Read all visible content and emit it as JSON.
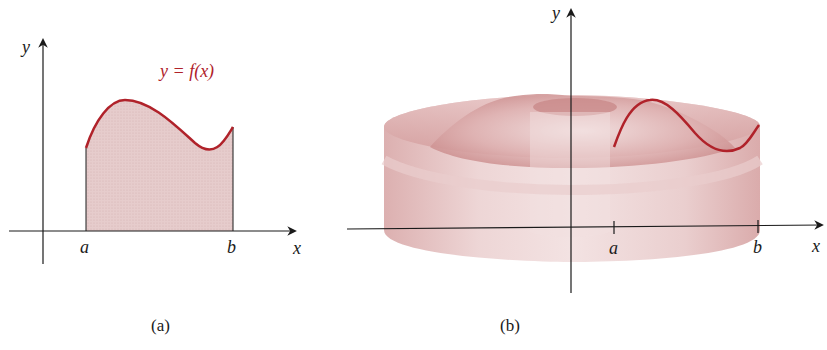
{
  "panel_a": {
    "y_label": "y",
    "x_label": "x",
    "a_label": "a",
    "b_label": "b",
    "curve_label": "y = f(x)",
    "caption": "(a)"
  },
  "panel_b": {
    "y_label": "y",
    "x_label": "x",
    "a_label": "a",
    "b_label": "b",
    "caption": "(b)"
  },
  "colors": {
    "curve": "#b0222a",
    "fill": "#e8cfcf",
    "solid": "#dcaeae",
    "axis": "#1a1a1a"
  }
}
